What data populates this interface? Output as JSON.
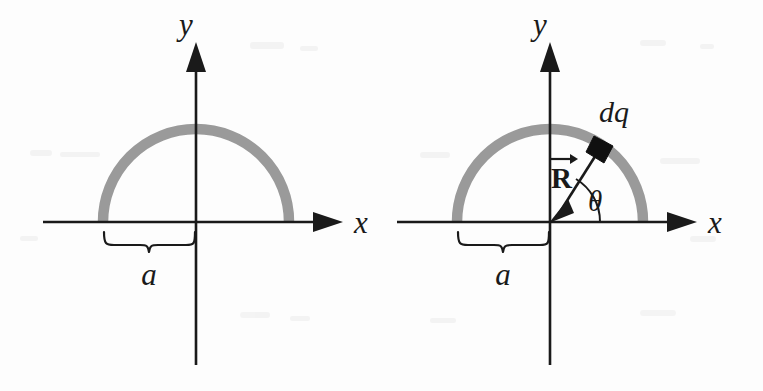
{
  "figure": {
    "caption": "",
    "background_color": "#fdfdfd",
    "ink_color": "#1a1a1a",
    "rod_color": "#9a9a9a",
    "dq_color": "#101010"
  },
  "panels": [
    {
      "id": "left",
      "name": "semicircular-rod-geometry",
      "origin": {
        "x": 196,
        "y": 222
      },
      "radius": 93,
      "axes": {
        "x_label": "x",
        "y_label": "y",
        "x_start": 43,
        "x_end": 340,
        "y_top": 45,
        "y_bottom": 365
      },
      "labels": {
        "radius_label": "a"
      },
      "brace": {
        "from_x": 103,
        "to_x": 196,
        "y": 228
      }
    },
    {
      "id": "right",
      "name": "semicircular-rod-with-charge-element",
      "origin": {
        "x": 550,
        "y": 222
      },
      "radius": 93,
      "axes": {
        "x_label": "x",
        "y_label": "y",
        "x_start": 397,
        "x_end": 694,
        "y_top": 45,
        "y_bottom": 365
      },
      "labels": {
        "radius_label": "a",
        "charge_element_label": "dq",
        "vector_label": "R",
        "angle_label": "θ"
      },
      "brace": {
        "from_x": 457,
        "to_x": 550,
        "y": 228
      },
      "charge_element": {
        "angle_deg": 58
      },
      "vector": {
        "from": "charge-element",
        "to": "origin",
        "label": "R"
      },
      "angle_arc": {
        "start_deg": 0,
        "end_deg": 58,
        "radius": 50
      }
    }
  ]
}
